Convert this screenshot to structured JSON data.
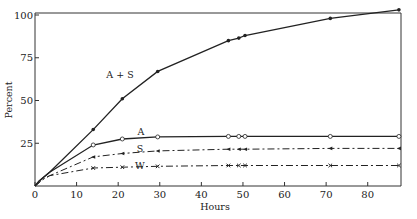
{
  "chart_data": {
    "type": "line",
    "title": "",
    "xlabel": "Hours",
    "ylabel": "Percent",
    "xlim": [
      0,
      88
    ],
    "ylim": [
      0,
      100
    ],
    "xticks": [
      0,
      10,
      20,
      30,
      40,
      50,
      60,
      70,
      80
    ],
    "yticks": [
      25,
      50,
      75,
      100
    ],
    "grid": false,
    "legend": "inline labels",
    "series": [
      {
        "name": "A + S",
        "style": "solid",
        "marker": "filled-dot",
        "x": [
          0,
          1,
          2,
          3.5,
          14,
          21,
          29.5,
          46.5,
          49,
          50.5,
          71,
          87.5
        ],
        "y": [
          0,
          3,
          5,
          8,
          33,
          51,
          67,
          85,
          86.5,
          88,
          98,
          103
        ]
      },
      {
        "name": "A",
        "style": "solid",
        "marker": "open-circle",
        "x": [
          0,
          1,
          2,
          3.5,
          14,
          21,
          29.5,
          46.5,
          49,
          50.5,
          71,
          87.5
        ],
        "y": [
          0,
          3,
          5,
          8,
          24,
          27.5,
          28.7,
          29,
          29,
          29,
          29,
          29
        ]
      },
      {
        "name": "S",
        "style": "dashed",
        "marker": "triangle",
        "x": [
          0,
          1,
          2,
          3.5,
          14,
          21,
          29.5,
          46.5,
          49,
          50.5,
          71,
          87.5
        ],
        "y": [
          0,
          2,
          4,
          6,
          17,
          19,
          20.5,
          21.5,
          21.5,
          21.5,
          22,
          22
        ]
      },
      {
        "name": "W",
        "style": "dashed",
        "marker": "cross",
        "x": [
          0,
          1,
          2,
          3.5,
          14,
          21,
          29.5,
          46.5,
          49,
          50.5,
          71,
          87.5
        ],
        "y": [
          0,
          2,
          4,
          6,
          10.5,
          11,
          11.5,
          12,
          12,
          12,
          12,
          12
        ]
      }
    ]
  }
}
